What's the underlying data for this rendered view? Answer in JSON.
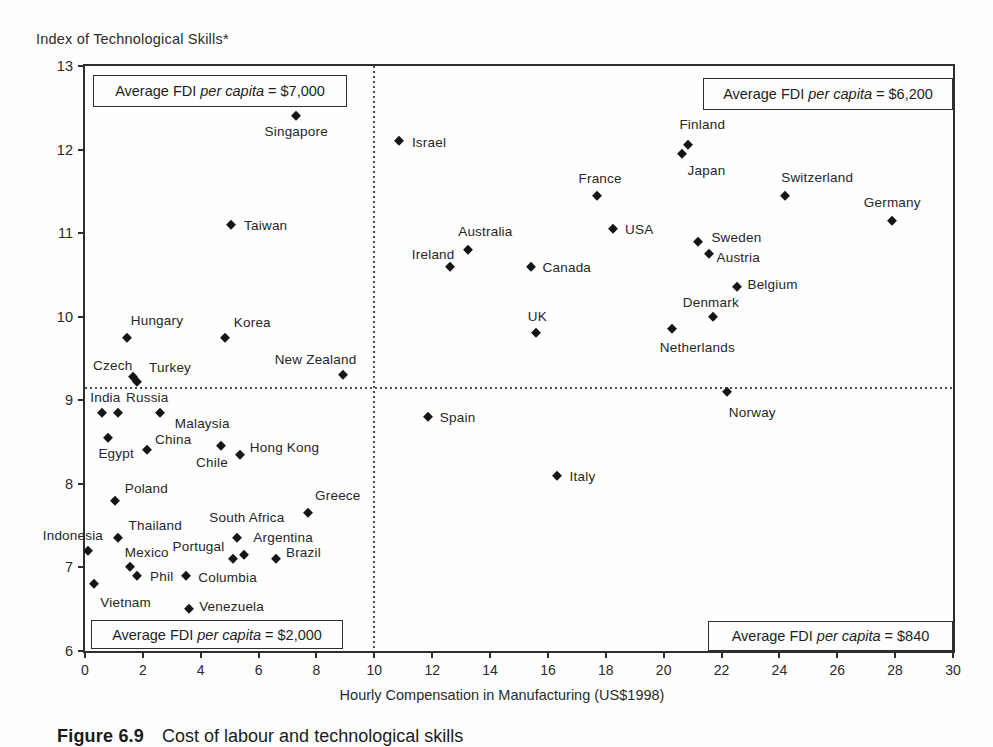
{
  "page": {
    "background": "#fefefe",
    "ink_color": "#1e1e1e"
  },
  "figure": {
    "y_axis_title": "Index of Technological Skills*",
    "x_axis_title": "Hourly Compensation in Manufacturing (US$1998)",
    "caption_label": "Figure 6.9",
    "caption_text": "Cost of labour and technological skills"
  },
  "quadrant_boxes": {
    "top_left": {
      "prefix": "Average FDI ",
      "italic": "per capita",
      "suffix": " = $7,000"
    },
    "top_right": {
      "prefix": "Average FDI ",
      "italic": "per capita",
      "suffix": " = $6,200"
    },
    "bottom_left": {
      "prefix": "Average FDI ",
      "italic": "per capita",
      "suffix": " = $2,000"
    },
    "bottom_right": {
      "prefix": "Average FDI ",
      "italic": "per capita",
      "suffix": " = $840"
    }
  },
  "chart_data": {
    "type": "scatter",
    "marker": "diamond",
    "marker_color": "#151515",
    "xlabel": "Hourly Compensation in Manufacturing (US$1998)",
    "ylabel": "Index of Technological Skills*",
    "xlim": [
      0,
      30
    ],
    "ylim": [
      6,
      13
    ],
    "x_ticks": [
      0,
      2,
      4,
      6,
      8,
      10,
      12,
      14,
      16,
      18,
      20,
      22,
      24,
      26,
      28,
      30
    ],
    "y_ticks": [
      13,
      12,
      11,
      10,
      9,
      8,
      7,
      6
    ],
    "grid": false,
    "reference_lines": {
      "vertical_x": 10,
      "horizontal_y": 9.15,
      "style": "dotted"
    },
    "points": [
      {
        "label": "Singapore",
        "x": 7.3,
        "y": 12.4,
        "pos": "below",
        "dx": 0,
        "dy": 0
      },
      {
        "label": "Taiwan",
        "x": 5.05,
        "y": 11.1,
        "pos": "right",
        "dx": 5,
        "dy": 0
      },
      {
        "label": "Hungary",
        "x": 1.45,
        "y": 9.75,
        "pos": "above",
        "dx": 30,
        "dy": -2
      },
      {
        "label": "Korea",
        "x": 4.85,
        "y": 9.75,
        "pos": "above",
        "dx": 27,
        "dy": 0
      },
      {
        "label": "New Zealand",
        "x": 8.9,
        "y": 9.3,
        "pos": "above",
        "dx": -27,
        "dy": 0
      },
      {
        "label": "Czech",
        "x": 1.65,
        "y": 9.28,
        "pos": "above",
        "dx": -20,
        "dy": 4
      },
      {
        "label": "Turkey",
        "x": 1.8,
        "y": 9.22,
        "pos": "above",
        "dx": 33,
        "dy": 1
      },
      {
        "label": "Israel",
        "x": 10.85,
        "y": 12.1,
        "pos": "right",
        "dx": 5,
        "dy": 1
      },
      {
        "label": "Finland",
        "x": 20.85,
        "y": 12.05,
        "pos": "above",
        "dx": 14,
        "dy": -5
      },
      {
        "label": "Japan",
        "x": 20.65,
        "y": 11.95,
        "pos": "below",
        "dx": 24,
        "dy": 1
      },
      {
        "label": "France",
        "x": 17.7,
        "y": 11.45,
        "pos": "above",
        "dx": 3,
        "dy": -2
      },
      {
        "label": "Switzerland",
        "x": 24.2,
        "y": 11.45,
        "pos": "above",
        "dx": 32,
        "dy": -3
      },
      {
        "label": "USA",
        "x": 18.25,
        "y": 11.05,
        "pos": "right",
        "dx": 4,
        "dy": 0
      },
      {
        "label": "Germany",
        "x": 27.9,
        "y": 11.15,
        "pos": "above",
        "dx": 0,
        "dy": -3
      },
      {
        "label": "Sweden",
        "x": 21.2,
        "y": 10.9,
        "pos": "right",
        "dx": 5,
        "dy": -5
      },
      {
        "label": "Austria",
        "x": 21.55,
        "y": 10.75,
        "pos": "right",
        "dx": 0,
        "dy": 3
      },
      {
        "label": "Australia",
        "x": 13.25,
        "y": 10.8,
        "pos": "above",
        "dx": 17,
        "dy": -3
      },
      {
        "label": "Ireland",
        "x": 12.6,
        "y": 10.6,
        "pos": "left",
        "dx": 13,
        "dy": -13
      },
      {
        "label": "Canada",
        "x": 15.4,
        "y": 10.6,
        "pos": "right",
        "dx": 4,
        "dy": 0
      },
      {
        "label": "Belgium",
        "x": 22.55,
        "y": 10.35,
        "pos": "right",
        "dx": 2,
        "dy": -3
      },
      {
        "label": "Denmark",
        "x": 21.7,
        "y": 10.0,
        "pos": "above",
        "dx": -2,
        "dy": 1
      },
      {
        "label": "Netherlands",
        "x": 20.3,
        "y": 9.85,
        "pos": "below",
        "dx": 25,
        "dy": 3
      },
      {
        "label": "UK",
        "x": 15.6,
        "y": 9.8,
        "pos": "above",
        "dx": 1,
        "dy": -1
      },
      {
        "label": "Norway",
        "x": 22.2,
        "y": 9.1,
        "pos": "below",
        "dx": 25,
        "dy": 5
      },
      {
        "label": "Spain",
        "x": 11.85,
        "y": 8.8,
        "pos": "right",
        "dx": 4,
        "dy": 0
      },
      {
        "label": "Italy",
        "x": 16.3,
        "y": 8.1,
        "pos": "right",
        "dx": 5,
        "dy": 0
      },
      {
        "label": "India",
        "x": 0.6,
        "y": 8.85,
        "pos": "above",
        "dx": 3,
        "dy": 0
      },
      {
        "label": "Russia",
        "x": 1.15,
        "y": 8.85,
        "pos": "above",
        "dx": 29,
        "dy": 0
      },
      {
        "label": "Malaysia",
        "x": 2.6,
        "y": 8.85,
        "pos": "below",
        "dx": 42,
        "dy": -5
      },
      {
        "label": "Egypt",
        "x": 0.8,
        "y": 8.55,
        "pos": "below",
        "dx": 8,
        "dy": 0
      },
      {
        "label": "China",
        "x": 2.15,
        "y": 8.4,
        "pos": "above",
        "dx": 26,
        "dy": 5
      },
      {
        "label": "Chile",
        "x": 4.7,
        "y": 8.45,
        "pos": "below",
        "dx": -9,
        "dy": 1
      },
      {
        "label": "Hong Kong",
        "x": 5.35,
        "y": 8.35,
        "pos": "right",
        "dx": 2,
        "dy": -8
      },
      {
        "label": "Poland",
        "x": 1.05,
        "y": 7.8,
        "pos": "above",
        "dx": 31,
        "dy": 3
      },
      {
        "label": "Greece",
        "x": 7.7,
        "y": 7.65,
        "pos": "above",
        "dx": 30,
        "dy": -2
      },
      {
        "label": "Thailand",
        "x": 1.15,
        "y": 7.35,
        "pos": "above",
        "dx": 37,
        "dy": 3
      },
      {
        "label": "Indonesia",
        "x": 0.1,
        "y": 7.2,
        "pos": "above",
        "dx": -15,
        "dy": 0
      },
      {
        "label": "South Africa",
        "x": 5.25,
        "y": 7.35,
        "pos": "above",
        "dx": 10,
        "dy": -5
      },
      {
        "label": "Argentina",
        "x": 5.5,
        "y": 7.15,
        "pos": "above",
        "dx": 39,
        "dy": -2
      },
      {
        "label": "Portugal",
        "x": 5.1,
        "y": 7.1,
        "pos": "above",
        "dx": -34,
        "dy": 3
      },
      {
        "label": "Brazil",
        "x": 6.6,
        "y": 7.1,
        "pos": "right",
        "dx": 2,
        "dy": -7
      },
      {
        "label": "Mexico",
        "x": 1.55,
        "y": 7.0,
        "pos": "above",
        "dx": 17,
        "dy": 1
      },
      {
        "label": "Phil",
        "x": 1.8,
        "y": 6.9,
        "pos": "right",
        "dx": 5,
        "dy": 0
      },
      {
        "label": "Columbia",
        "x": 3.5,
        "y": 6.9,
        "pos": "right",
        "dx": 4,
        "dy": 1
      },
      {
        "label": "Vietnam",
        "x": 0.3,
        "y": 6.8,
        "pos": "below",
        "dx": 32,
        "dy": 3
      },
      {
        "label": "Venezuela",
        "x": 3.6,
        "y": 6.5,
        "pos": "right",
        "dx": 2,
        "dy": -3
      }
    ]
  }
}
